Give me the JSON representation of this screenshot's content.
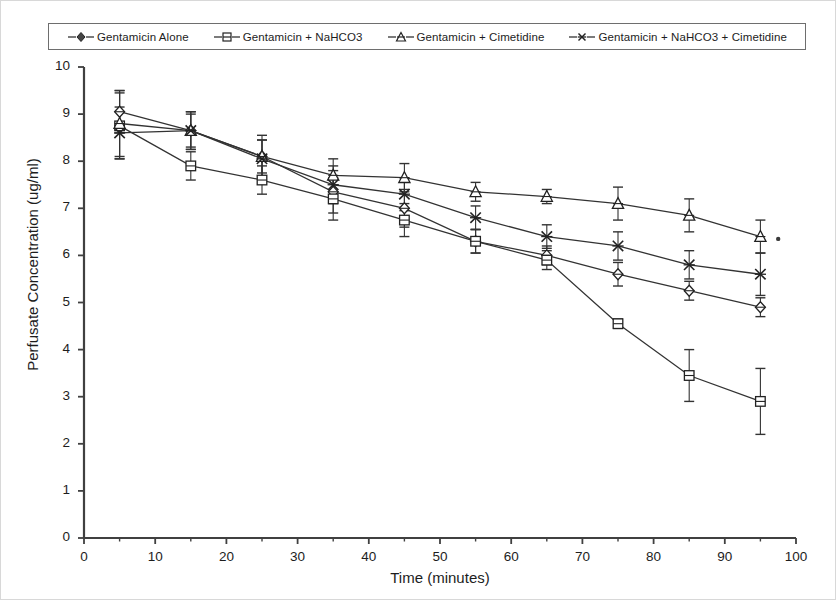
{
  "chart_data": {
    "type": "line",
    "title": "",
    "xlabel": "Time (minutes)",
    "ylabel": "Perfusate Concentration (ug/ml)",
    "xlim": [
      0,
      100
    ],
    "ylim": [
      0,
      10
    ],
    "xticks": [
      "0",
      "10",
      "20",
      "30",
      "40",
      "50",
      "60",
      "70",
      "80",
      "90",
      "100"
    ],
    "yticks": [
      "0",
      "1",
      "2",
      "3",
      "4",
      "5",
      "6",
      "7",
      "8",
      "9",
      "10"
    ],
    "grid": false,
    "legend_position": "top",
    "error_bars": "symmetric vertical error bars on all points",
    "x": [
      5,
      15,
      25,
      35,
      45,
      55,
      65,
      75,
      85,
      95
    ],
    "series": [
      {
        "name": "Gentamicin Alone",
        "marker": "diamond",
        "values": [
          9.05,
          8.65,
          8.1,
          7.35,
          7.0,
          6.3,
          6.0,
          5.6,
          5.25,
          4.9
        ],
        "errors": [
          0.45,
          0.35,
          0.35,
          0.45,
          0.4,
          0.25,
          0.2,
          0.25,
          0.2,
          0.2
        ]
      },
      {
        "name": "Gentamicin + NaHCO3",
        "marker": "square",
        "values": [
          8.75,
          7.9,
          7.6,
          7.2,
          6.75,
          6.3,
          5.9,
          4.55,
          3.45,
          2.9
        ],
        "errors": [
          0.7,
          0.3,
          0.3,
          0.45,
          0.35,
          0.25,
          0.2,
          0.1,
          0.55,
          0.7
        ]
      },
      {
        "name": "Gentamicin + Cimetidine",
        "marker": "triangle",
        "values": [
          8.8,
          8.65,
          8.1,
          7.7,
          7.65,
          7.35,
          7.25,
          7.1,
          6.85,
          6.4
        ],
        "errors": [
          0.7,
          0.4,
          0.45,
          0.35,
          0.3,
          0.2,
          0.15,
          0.35,
          0.35,
          0.35
        ]
      },
      {
        "name": "Gentamicin + NaHCO3 + Cimetidine",
        "marker": "cross",
        "values": [
          8.6,
          8.65,
          8.05,
          7.5,
          7.3,
          6.8,
          6.4,
          6.2,
          5.8,
          5.6
        ],
        "errors": [
          0.55,
          0.4,
          0.4,
          0.4,
          0.35,
          0.25,
          0.25,
          0.3,
          0.3,
          0.45
        ]
      }
    ],
    "annotations": [
      {
        "type": "dot",
        "x": 97.5,
        "y": 6.35
      }
    ],
    "colors": {
      "line": "#333333",
      "axis": "#404040",
      "text": "#1d1d1d",
      "frame": "#6e6e6e"
    }
  }
}
